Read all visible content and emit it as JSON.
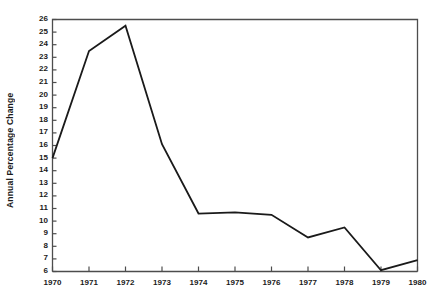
{
  "chart_data": {
    "type": "line",
    "title": "",
    "xlabel": "",
    "ylabel": "Annual Percentage Change",
    "x": [
      1970,
      1971,
      1972,
      1973,
      1974,
      1975,
      1976,
      1977,
      1978,
      1979,
      1980
    ],
    "categories": [
      "1970",
      "1971",
      "1972",
      "1973",
      "1974",
      "1975",
      "1976",
      "1977",
      "1978",
      "1979",
      "1980"
    ],
    "values": [
      15.0,
      23.5,
      25.5,
      16.1,
      10.6,
      10.7,
      10.5,
      8.7,
      9.5,
      6.1,
      6.9
    ],
    "series": [
      {
        "name": "Annual Percentage Change",
        "values": [
          15.0,
          23.5,
          25.5,
          16.1,
          10.6,
          10.7,
          10.5,
          8.7,
          9.5,
          6.1,
          6.9
        ]
      }
    ],
    "ylim": [
      6,
      26
    ],
    "xlim": [
      1970,
      1980
    ],
    "ytick_labels": [
      "26",
      "25",
      "24",
      "23",
      "22",
      "21",
      "20",
      "19",
      "18",
      "17",
      "16",
      "15",
      "14",
      "13",
      "12",
      "11",
      "10",
      "9",
      "8",
      "7",
      "6"
    ],
    "ytick_values": [
      26,
      25,
      24,
      23,
      22,
      21,
      20,
      19,
      18,
      17,
      16,
      15,
      14,
      13,
      12,
      11,
      10,
      9,
      8,
      7,
      6
    ],
    "xtick_labels": [
      "1970",
      "1971",
      "1972",
      "1973",
      "1974",
      "1975",
      "1976",
      "1977",
      "1978",
      "1979",
      "1980"
    ],
    "grid": false,
    "legend": null,
    "line_color": "#1a1a1a",
    "frame_color": "#4d4d4d",
    "background_color": "#ffffff"
  }
}
